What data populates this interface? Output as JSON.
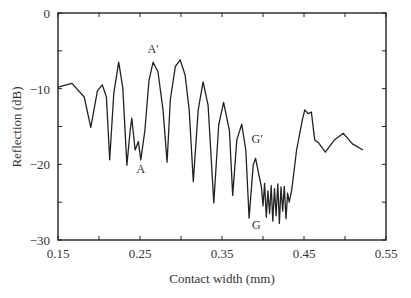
{
  "chart_data": {
    "type": "line",
    "title": "",
    "xlabel": "Contact width (mm)",
    "ylabel": "Reflection (dB)",
    "xlim": [
      0.15,
      0.55
    ],
    "ylim": [
      -30,
      0
    ],
    "xticks": [
      0.15,
      0.25,
      0.35,
      0.45,
      0.55
    ],
    "xtick_labels": [
      "0.15",
      "0.25",
      "0.35",
      "0.45",
      "0.55"
    ],
    "xminor_ticks": [
      0.2,
      0.3,
      0.4,
      0.5
    ],
    "yticks": [
      0,
      -10,
      -20,
      -30
    ],
    "ytick_labels": [
      "0",
      "−10",
      "−20",
      "−30"
    ],
    "yminor_ticks": [
      -5,
      -15,
      -25
    ],
    "grid": false,
    "legend": null,
    "line_color": "#222222",
    "series": [
      {
        "name": "Reflection",
        "x": [
          0.15,
          0.167,
          0.182,
          0.19,
          0.198,
          0.204,
          0.209,
          0.213,
          0.218,
          0.224,
          0.229,
          0.234,
          0.238,
          0.24,
          0.244,
          0.248,
          0.251,
          0.256,
          0.261,
          0.266,
          0.272,
          0.278,
          0.283,
          0.287,
          0.293,
          0.299,
          0.305,
          0.31,
          0.315,
          0.321,
          0.327,
          0.333,
          0.34,
          0.346,
          0.352,
          0.359,
          0.363,
          0.368,
          0.374,
          0.379,
          0.383,
          0.388,
          0.391,
          0.395,
          0.398,
          0.4,
          0.402,
          0.404,
          0.406,
          0.408,
          0.41,
          0.412,
          0.414,
          0.416,
          0.418,
          0.42,
          0.422,
          0.424,
          0.426,
          0.428,
          0.43,
          0.432,
          0.435,
          0.441,
          0.448,
          0.451,
          0.455,
          0.459,
          0.463,
          0.468,
          0.476,
          0.487,
          0.498,
          0.509,
          0.522
        ],
        "y": [
          -9.8,
          -9.3,
          -11.1,
          -15.1,
          -10.3,
          -9.5,
          -11.1,
          -19.4,
          -10.6,
          -6.5,
          -9.9,
          -20.1,
          -15.5,
          -13.9,
          -18.1,
          -17.0,
          -19.4,
          -15.5,
          -8.9,
          -6.5,
          -7.8,
          -12.8,
          -19.7,
          -11.5,
          -7.1,
          -6.2,
          -8.2,
          -12.8,
          -22.3,
          -12.8,
          -9.1,
          -12.2,
          -25.1,
          -14.8,
          -11.8,
          -15.5,
          -24.1,
          -16.8,
          -14.7,
          -18.1,
          -27.1,
          -20.1,
          -19.2,
          -21.4,
          -23.0,
          -25.5,
          -22.5,
          -27.0,
          -23.5,
          -26.5,
          -22.8,
          -27.5,
          -23.2,
          -26.8,
          -22.6,
          -27.8,
          -23.0,
          -26.2,
          -22.9,
          -27.2,
          -23.8,
          -25.0,
          -23.4,
          -18.1,
          -14.1,
          -12.8,
          -13.3,
          -13.1,
          -16.8,
          -17.2,
          -18.4,
          -16.8,
          -15.9,
          -17.3,
          -18.1
        ]
      }
    ],
    "annotations": [
      {
        "text": "A′",
        "x": 0.266,
        "y": -5.3
      },
      {
        "text": "A",
        "x": 0.251,
        "y": -21.2
      },
      {
        "text": "G′",
        "x": 0.393,
        "y": -17.2
      },
      {
        "text": "G",
        "x": 0.392,
        "y": -28.6
      }
    ]
  }
}
